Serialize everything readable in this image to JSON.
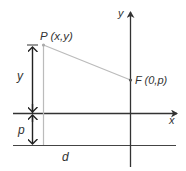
{
  "diagram": {
    "labels": {
      "point_p": "P (x,y)",
      "focus": "F (0,p)",
      "y_axis": "y",
      "x_axis": "x",
      "dist_y": "y",
      "dist_p": "p",
      "dist_d": "d"
    },
    "colors": {
      "axis": "#333333",
      "guide": "#bbbbbb",
      "text": "#333333"
    }
  }
}
